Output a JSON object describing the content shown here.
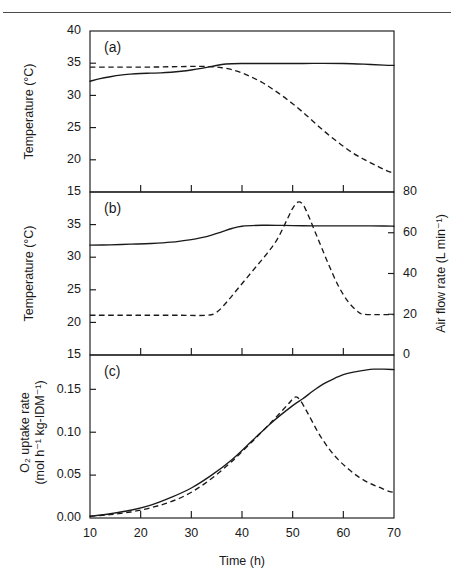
{
  "figure": {
    "xlabel": "Time (h)",
    "panels": [
      "(a)",
      "(b)",
      "(c)"
    ]
  },
  "chart_data": [
    {
      "type": "line",
      "panel": "(a)",
      "title": "",
      "xlabel": "Time (h)",
      "ylabel": "Temperature (°C)",
      "xlim": [
        10,
        70
      ],
      "ylim": [
        15,
        40
      ],
      "xticks": [
        10,
        20,
        30,
        40,
        50,
        60,
        70
      ],
      "yticks": [
        15,
        20,
        25,
        30,
        35,
        40
      ],
      "grid": false,
      "legend": "none",
      "series": [
        {
          "name": "Temperature (solid)",
          "style": "solid",
          "x": [
            10,
            12,
            14,
            16,
            18,
            20,
            22,
            24,
            26,
            28,
            30,
            32,
            34,
            36,
            38,
            40,
            44,
            48,
            52,
            56,
            60,
            64,
            68,
            70
          ],
          "values": [
            32.2,
            32.6,
            32.9,
            33.15,
            33.3,
            33.4,
            33.45,
            33.5,
            33.6,
            33.75,
            33.95,
            34.2,
            34.5,
            34.8,
            34.92,
            34.95,
            34.95,
            34.95,
            34.95,
            34.97,
            34.95,
            34.85,
            34.7,
            34.65
          ]
        },
        {
          "name": "Temperature (dashed)",
          "style": "dashed",
          "x": [
            10,
            14,
            18,
            22,
            26,
            30,
            32,
            34,
            36,
            38,
            40,
            42,
            44,
            46,
            48,
            50,
            52,
            54,
            56,
            58,
            60,
            62,
            64,
            66,
            68,
            70
          ],
          "values": [
            34.4,
            34.4,
            34.4,
            34.4,
            34.45,
            34.5,
            34.5,
            34.45,
            34.3,
            34.0,
            33.5,
            32.8,
            32.0,
            31.0,
            29.9,
            28.7,
            27.4,
            26.0,
            24.6,
            23.3,
            22.1,
            21.0,
            20.1,
            19.3,
            18.5,
            17.9
          ]
        }
      ]
    },
    {
      "type": "line",
      "panel": "(b)",
      "title": "",
      "xlabel": "Time (h)",
      "ylabel": "Temperature (°C)",
      "y2label": "Air flow rate  (L min⁻¹)",
      "xlim": [
        10,
        70
      ],
      "ylim": [
        15,
        40
      ],
      "y2lim": [
        0,
        80
      ],
      "xticks": [
        10,
        20,
        30,
        40,
        50,
        60,
        70
      ],
      "yticks": [
        15,
        20,
        25,
        30,
        35
      ],
      "y2ticks": [
        0,
        20,
        40,
        60,
        80
      ],
      "grid": false,
      "legend": "none",
      "series": [
        {
          "name": "Temperature (solid)",
          "style": "solid",
          "axis": "left",
          "x": [
            10,
            14,
            18,
            22,
            26,
            30,
            32,
            34,
            36,
            38,
            40,
            44,
            48,
            52,
            56,
            60,
            64,
            68,
            70
          ],
          "values": [
            31.85,
            31.9,
            32.0,
            32.1,
            32.3,
            32.7,
            33.0,
            33.4,
            33.9,
            34.4,
            34.75,
            34.9,
            34.88,
            34.82,
            34.8,
            34.8,
            34.8,
            34.78,
            34.75
          ]
        },
        {
          "name": "Air flow rate (dashed)",
          "style": "dashed",
          "axis": "right",
          "x": [
            10,
            16,
            22,
            28,
            33,
            35,
            37,
            39,
            41,
            43,
            45,
            47,
            49,
            50,
            51,
            52,
            53,
            55,
            57,
            59,
            61,
            63,
            64,
            66,
            68,
            70
          ],
          "values": [
            19.5,
            19.5,
            19.5,
            19.5,
            19.5,
            21,
            26,
            32,
            38,
            44,
            50,
            57,
            67,
            72,
            75,
            74,
            69,
            57,
            45,
            34,
            26,
            21,
            20,
            19.8,
            19.8,
            19.8
          ]
        }
      ]
    },
    {
      "type": "line",
      "panel": "(c)",
      "title": "",
      "xlabel": "Time (h)",
      "ylabel": "O₂ uptake rate (mol h⁻¹ kg-IDM⁻¹)",
      "ylabel_line1": "O₂ uptake rate",
      "ylabel_line2": "(mol h⁻¹ kg-IDM⁻¹)",
      "xlim": [
        10,
        70
      ],
      "ylim": [
        0.0,
        0.19
      ],
      "xticks": [
        10,
        20,
        30,
        40,
        50,
        60,
        70
      ],
      "yticks": [
        0.0,
        0.05,
        0.1,
        0.15
      ],
      "ytick_labels": [
        "0.00",
        "0.05",
        "0.10",
        "0.15"
      ],
      "grid": false,
      "legend": "none",
      "series": [
        {
          "name": "O2 uptake rate (solid)",
          "style": "solid",
          "x": [
            10,
            14,
            18,
            22,
            26,
            30,
            34,
            38,
            42,
            46,
            50,
            52,
            54,
            56,
            58,
            60,
            62,
            64,
            66,
            68,
            70
          ],
          "values": [
            0.002,
            0.005,
            0.009,
            0.015,
            0.024,
            0.035,
            0.05,
            0.068,
            0.09,
            0.112,
            0.131,
            0.139,
            0.148,
            0.156,
            0.162,
            0.167,
            0.17,
            0.172,
            0.1735,
            0.1735,
            0.173
          ]
        },
        {
          "name": "O2 uptake rate (dashed)",
          "style": "dashed",
          "x": [
            10,
            14,
            18,
            22,
            26,
            30,
            34,
            38,
            42,
            46,
            49,
            50.5,
            51.5,
            53,
            55,
            57,
            59,
            61,
            63,
            65,
            67,
            69,
            70
          ],
          "values": [
            0.002,
            0.004,
            0.007,
            0.012,
            0.019,
            0.03,
            0.046,
            0.066,
            0.089,
            0.113,
            0.132,
            0.141,
            0.137,
            0.122,
            0.1,
            0.082,
            0.068,
            0.057,
            0.048,
            0.041,
            0.036,
            0.031,
            0.03
          ]
        }
      ]
    }
  ]
}
